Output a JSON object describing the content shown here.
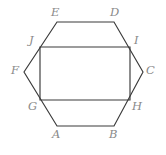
{
  "figure": {
    "background_color": "#ffffff",
    "stroke_color": "#3a3a3a",
    "label_color": "#8a8a8a",
    "width": 166,
    "height": 155,
    "hexagon": {
      "name": "ABCDEF",
      "closed": true,
      "points": "57,126 114,126 143,72 114,22 57,22 24,72",
      "vertices": [
        {
          "id": "A",
          "label": "A",
          "x": 57,
          "y": 126,
          "label_x": 52,
          "label_y": 129
        },
        {
          "id": "B",
          "label": "B",
          "x": 114,
          "y": 126,
          "label_x": 109,
          "label_y": 129
        },
        {
          "id": "C",
          "label": "C",
          "x": 143,
          "y": 72,
          "label_x": 146,
          "label_y": 65
        },
        {
          "id": "D",
          "label": "D",
          "x": 114,
          "y": 22,
          "label_x": 110,
          "label_y": 7
        },
        {
          "id": "E",
          "label": "E",
          "x": 57,
          "y": 22,
          "label_x": 51,
          "label_y": 7
        },
        {
          "id": "F",
          "label": "F",
          "x": 24,
          "y": 72,
          "label_x": 11,
          "label_y": 65
        }
      ]
    },
    "rectangle": {
      "name": "JIHG",
      "closed": true,
      "points": "40,47 130,47 130,100 40,100",
      "vertices": [
        {
          "id": "J",
          "label": "J",
          "x": 40,
          "y": 47,
          "label_x": 29,
          "label_y": 35
        },
        {
          "id": "I",
          "label": "I",
          "x": 130,
          "y": 47,
          "label_x": 134,
          "label_y": 35
        },
        {
          "id": "H",
          "label": "H",
          "x": 130,
          "y": 100,
          "label_x": 132,
          "label_y": 101
        },
        {
          "id": "G",
          "label": "G",
          "x": 40,
          "y": 100,
          "label_x": 28,
          "label_y": 101
        }
      ]
    }
  }
}
